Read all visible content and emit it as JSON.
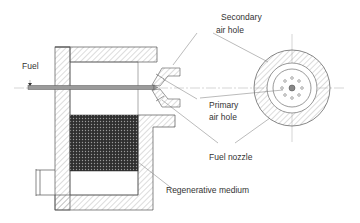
{
  "diagram": {
    "labels": {
      "fuel": "Fuel",
      "secondary_air_hole_line1": "Secondary",
      "secondary_air_hole_line2": "air hole",
      "primary_air_hole_line1": "Primary",
      "primary_air_hole_line2": "air hole",
      "fuel_nozzle": "Fuel nozzle",
      "regenerative_medium": "Regenerative medium"
    },
    "colors": {
      "line": "#555555",
      "hatch": "#8a8a8a",
      "pipe": "#9a9a9a",
      "medium": "#3a3a3a",
      "text": "#333333"
    }
  }
}
